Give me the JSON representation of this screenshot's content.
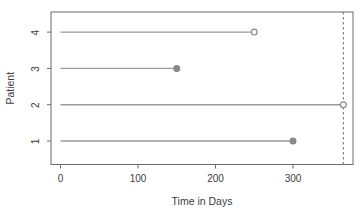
{
  "figure": {
    "background": "#ffffff"
  },
  "chart_data": {
    "type": "line",
    "title": "",
    "xlabel": "Time in Days",
    "ylabel": "Patient",
    "x_ticks": [
      0,
      100,
      200,
      300
    ],
    "y_ticks": [
      1,
      2,
      3,
      4
    ],
    "xlim": [
      -13,
      378
    ],
    "ylim": [
      0.35,
      4.55
    ],
    "grid": "off",
    "legend": "none",
    "reference_line": {
      "x": 365,
      "style": "dashed",
      "color": "#858585"
    },
    "series": [
      {
        "patient": 4,
        "start": 0,
        "end": 250,
        "marker": "open"
      },
      {
        "patient": 3,
        "start": 0,
        "end": 150,
        "marker": "filled"
      },
      {
        "patient": 2,
        "start": 0,
        "end": 365,
        "marker": "open"
      },
      {
        "patient": 1,
        "start": 0,
        "end": 300,
        "marker": "filled"
      }
    ],
    "colors": {
      "segment_line": "#9a9a9a",
      "marker_stroke": "#888888",
      "marker_filled_fill": "#8a8a8a",
      "marker_open_fill": "#ffffff",
      "plot_box": "#6b6b6b",
      "tick": "#6b6b6b",
      "text": "#3d3d3d"
    }
  }
}
